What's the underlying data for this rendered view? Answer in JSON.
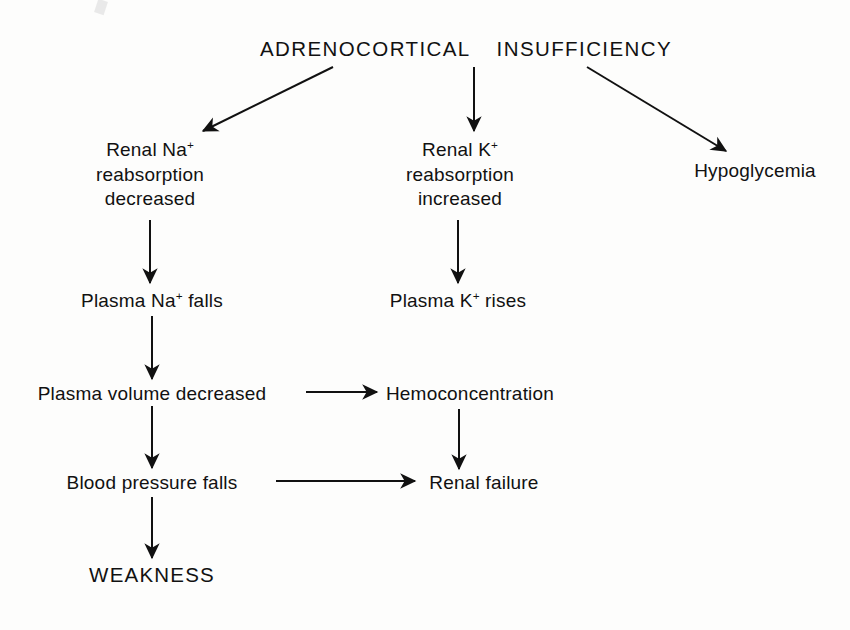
{
  "diagram": {
    "type": "flowchart",
    "ink_color": "#111111",
    "background_color": "#fdfdfc",
    "root": {
      "word_1": "ADRENOCORTICAL",
      "word_2": "INSUFFICIENCY"
    },
    "nodes": {
      "renal_na": {
        "line1_text": "Renal Na",
        "line1_sup": "+",
        "line2": "reabsorption",
        "line3": "decreased"
      },
      "renal_k": {
        "line1_text": "Renal K",
        "line1_sup": "+",
        "line2": "reabsorption",
        "line3": "increased"
      },
      "hypoglycemia": {
        "label": "Hypoglycemia"
      },
      "plasma_na": {
        "pre": "Plasma Na",
        "sup": "+",
        "post": " falls"
      },
      "plasma_k": {
        "pre": "Plasma K",
        "sup": "+",
        "post": " rises"
      },
      "plasma_volume": {
        "label": "Plasma volume decreased"
      },
      "hemoconcentration": {
        "label": "Hemoconcentration"
      },
      "blood_pressure": {
        "label": "Blood pressure falls"
      },
      "renal_failure": {
        "label": "Renal failure"
      },
      "weakness": {
        "label": "WEAKNESS"
      }
    },
    "edges": [
      {
        "name": "root-to-renal-na",
        "kind": "diagonal-left"
      },
      {
        "name": "root-to-renal-k",
        "kind": "vertical"
      },
      {
        "name": "root-to-hypoglycemia",
        "kind": "diagonal-right"
      },
      {
        "name": "renal-na-to-plasma-na",
        "kind": "vertical"
      },
      {
        "name": "renal-k-to-plasma-k",
        "kind": "vertical"
      },
      {
        "name": "plasma-na-to-plasma-volume",
        "kind": "vertical"
      },
      {
        "name": "plasma-volume-to-hemoconcentration",
        "kind": "horizontal"
      },
      {
        "name": "plasma-volume-to-blood-pressure",
        "kind": "vertical"
      },
      {
        "name": "hemoconcentration-to-renal-failure",
        "kind": "vertical"
      },
      {
        "name": "blood-pressure-to-renal-failure",
        "kind": "horizontal"
      },
      {
        "name": "blood-pressure-to-weakness",
        "kind": "vertical"
      }
    ]
  }
}
